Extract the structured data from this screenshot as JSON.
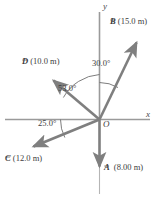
{
  "figure": {
    "type": "vector-diagram",
    "background": "#ffffff",
    "width": 158,
    "height": 200,
    "axes": {
      "x_label": "x",
      "y_label": "y",
      "origin_label": "O",
      "axis_color": "#9a9a9a"
    },
    "vector_color": "#7f7f7f",
    "text_color": "#3d3d3d",
    "vectors": [
      {
        "id": "A",
        "symbol": "A",
        "magnitude": "(8.00 m)",
        "label": "A (8.00 m)",
        "direction_deg": 270,
        "description": "points straight down along negative y-axis"
      },
      {
        "id": "B",
        "symbol": "B",
        "magnitude": "(15.0 m)",
        "label": "B (15.0 m)",
        "direction_deg": 60,
        "description": "points up and to the right, 30.0 degrees from the positive y-axis"
      },
      {
        "id": "C",
        "symbol": "C",
        "magnitude": "(12.0 m)",
        "label": "C (12.0 m)",
        "direction_deg": 205,
        "description": "points down and to the left, 25.0 degrees below the negative x-axis"
      },
      {
        "id": "D",
        "symbol": "D",
        "magnitude": "(10.0 m)",
        "label": "D (10.0 m)",
        "direction_deg": 143,
        "description": "points up and to the left, 53.0 degrees from the positive y-axis"
      }
    ],
    "angles": [
      {
        "id": "angle-b",
        "label": "30.0°",
        "value": 30.0,
        "between": "positive y-axis and vector B"
      },
      {
        "id": "angle-d",
        "label": "53.0°",
        "value": 53.0,
        "between": "positive y-axis and vector D"
      },
      {
        "id": "angle-c",
        "label": "25.0°",
        "value": 25.0,
        "between": "negative x-axis and vector C"
      }
    ]
  }
}
